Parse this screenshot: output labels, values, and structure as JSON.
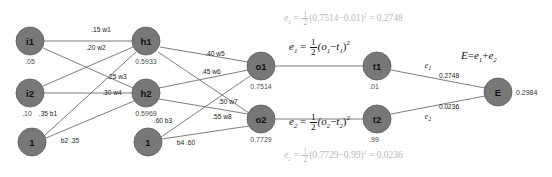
{
  "diagram": {
    "colors": {
      "node_fill": "#787878",
      "edge": "#6e6e6e",
      "text": "#111111",
      "faded_text": "#b8b8b8",
      "value_text": "#4d4d4d",
      "background": "#ffffff"
    },
    "nodes": [
      {
        "id": "i1",
        "label": "i1",
        "value": ".05",
        "cx": 30,
        "cy": 41,
        "r": 14
      },
      {
        "id": "i2",
        "label": "i2",
        "value": ".10",
        "cx": 30,
        "cy": 93,
        "r": 14
      },
      {
        "id": "b1",
        "label": "1",
        "value": "",
        "cx": 32,
        "cy": 142,
        "r": 14
      },
      {
        "id": "h1",
        "label": "h1",
        "value": "0.5933",
        "cx": 146,
        "cy": 41,
        "r": 14
      },
      {
        "id": "h2",
        "label": "h2",
        "value": "0.5969",
        "cx": 146,
        "cy": 93,
        "r": 14
      },
      {
        "id": "b2",
        "label": "1",
        "value": "",
        "cx": 148,
        "cy": 142,
        "r": 14
      },
      {
        "id": "o1",
        "label": "o1",
        "value": "0.7514",
        "cx": 261,
        "cy": 66,
        "r": 14
      },
      {
        "id": "o2",
        "label": "o2",
        "value": "0.7729",
        "cx": 261,
        "cy": 119,
        "r": 14
      },
      {
        "id": "t1",
        "label": "t1",
        "value": ".01",
        "cx": 377,
        "cy": 66,
        "r": 14
      },
      {
        "id": "t2",
        "label": "t2",
        "value": ".99",
        "cx": 377,
        "cy": 119,
        "r": 14
      },
      {
        "id": "E",
        "label": "E",
        "value": "0.2984",
        "cx": 498,
        "cy": 92,
        "r": 14
      }
    ],
    "edge_labels": {
      "w1": ".15 w1",
      "w2": ".20 w2",
      "w3": ".25 w3",
      "w4": ".30 w4",
      "w5": ".40 w5",
      "w6": ".45 w6",
      "w7": ".50 w7",
      "w8": ".55 w8",
      "b1": ".35 b1",
      "b2": "b2 .35",
      "b3": ".60 b3",
      "b4": "b4 .60",
      "e1_sym": "e",
      "e1_sub": "1",
      "e1_val": "0.2748",
      "e2_sym": "e",
      "e2_sub": "2",
      "e2_val": "0.0236"
    },
    "equations": {
      "e1_symbolic": {
        "lhs": "e",
        "lhs_sub": "1",
        "num": "1",
        "den": "2",
        "expr_open": "(o",
        "expr_sub1": "1",
        "minus": "−",
        "expr_t": "t",
        "expr_sub2": "1",
        "expr_close": ")",
        "exp": "2"
      },
      "e1_numeric": {
        "lhs": "e",
        "lhs_sub": "1",
        "num": "1",
        "den": "2",
        "expr": "(0.7514−0.01)",
        "exp": "2",
        "eq": "=",
        "result": "0.2748"
      },
      "e2_symbolic": {
        "lhs": "e",
        "lhs_sub": "2",
        "num": "1",
        "den": "2",
        "expr_open": "(o",
        "expr_sub1": "2",
        "minus": "−",
        "expr_t": "t",
        "expr_sub2": "2",
        "expr_close": ")",
        "exp": "2"
      },
      "e2_numeric": {
        "lhs": "e",
        "lhs_sub": "2",
        "num": "1",
        "den": "2",
        "expr": "(0.7729−0.99)",
        "exp": "2",
        "eq": "=",
        "result": "0.0236"
      },
      "total_error": {
        "lhs": "E",
        "eq": "=",
        "term1": "e",
        "term1_sub": "1",
        "plus": "+",
        "term2": "e",
        "term2_sub": "2"
      }
    }
  }
}
